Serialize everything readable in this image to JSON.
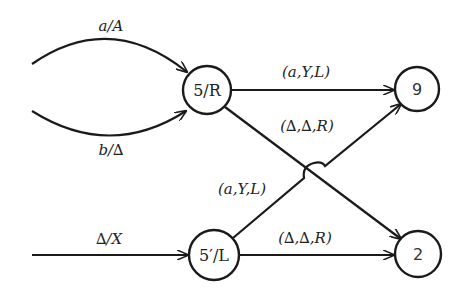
{
  "diagram": {
    "type": "state-transition",
    "nodes": [
      {
        "id": "n5R",
        "label": "5/R",
        "cx": 207,
        "cy": 90,
        "r": 24
      },
      {
        "id": "n9",
        "label": "9",
        "cx": 417,
        "cy": 89,
        "r": 22
      },
      {
        "id": "n5pL",
        "label": "5′/L",
        "cx": 214,
        "cy": 255,
        "r": 25
      },
      {
        "id": "n2",
        "label": "2",
        "cx": 418,
        "cy": 254,
        "r": 23
      }
    ],
    "edges": [
      {
        "id": "e_in_a",
        "label": "a/A",
        "from": "",
        "to": "n5R"
      },
      {
        "id": "e_in_b",
        "label": "b/∆",
        "from": "",
        "to": "n5R"
      },
      {
        "id": "e_in_delta",
        "label": "∆/X",
        "from": "",
        "to": "n5pL"
      },
      {
        "id": "e_5R_9",
        "label": "(a,Y,L)",
        "from": "n5R",
        "to": "n9"
      },
      {
        "id": "e_5R_2",
        "label": "(∆,∆,R)",
        "from": "n5R",
        "to": "n2"
      },
      {
        "id": "e_5pL_9",
        "label": "(a,Y,L)",
        "from": "n5pL",
        "to": "n9"
      },
      {
        "id": "e_5pL_2",
        "label": "(∆,∆,R)",
        "from": "n5pL",
        "to": "n2"
      }
    ]
  },
  "colors": {
    "stroke": "#1a1a1a",
    "background": "#ffffff"
  }
}
